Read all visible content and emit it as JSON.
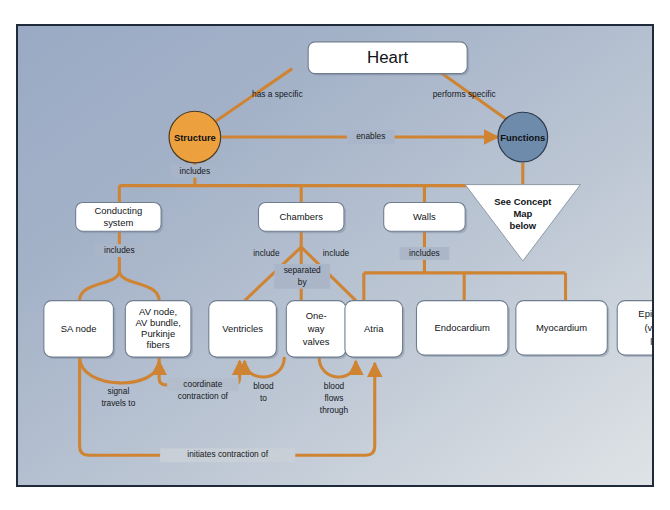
{
  "diagram": {
    "title": "Heart",
    "root": {
      "label": "Heart"
    },
    "branches": {
      "structure": {
        "label": "Structure",
        "color": "#eda13e"
      },
      "functions": {
        "label": "Functions",
        "color": "#6f8bab"
      }
    },
    "callout": {
      "line1": "See Concept",
      "line2": "Map",
      "line3": "below"
    },
    "nodes": {
      "conducting_system": "Conducting\nsystem",
      "conducting_system_l1": "Conducting",
      "conducting_system_l2": "system",
      "chambers": "Chambers",
      "walls": "Walls",
      "sa_node": "SA node",
      "av_node_l1": "AV node,",
      "av_node_l2": "AV bundle,",
      "av_node_l3": "Purkinje",
      "av_node_l4": "fibers",
      "ventricles": "Ventricles",
      "oneway_l1": "One-",
      "oneway_l2": "way",
      "oneway_l3": "valves",
      "atria": "Atria",
      "endocardium": "Endocardium",
      "myocardium": "Myocardium",
      "epicardium_l1": "Epicardium",
      "epicardium_l2": "(visceral",
      "epicardium_l3": "layer)"
    },
    "edge_labels": {
      "has_a_specific": "has a specific",
      "performs_specific": "performs specific",
      "enables": "enables",
      "includes_structure": "includes",
      "includes_conducting": "includes",
      "include_left": "include",
      "separated_by_l1": "separated",
      "separated_by_l2": "by",
      "include_right": "include",
      "includes_walls": "includes",
      "signal_travels_l1": "signal",
      "signal_travels_l2": "travels to",
      "coordinate_l1": "coordinate",
      "coordinate_l2": "contraction of",
      "blood_to_l1": "blood",
      "blood_to_l2": "to",
      "blood_flows_l1": "blood",
      "blood_flows_l2": "flows",
      "blood_flows_l3": "through",
      "initiates": "initiates contraction of"
    },
    "colors": {
      "link": "#cf8434",
      "structure_fill": "#eda13e",
      "functions_fill": "#6f8bab",
      "border": "#1f2a3a",
      "box_fill": "#ffffff"
    }
  }
}
